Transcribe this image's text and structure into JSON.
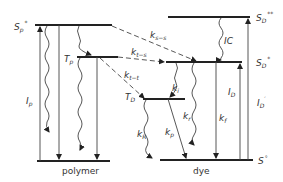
{
  "diagram": {
    "type": "energy-level (Jablonski) diagram",
    "groups": {
      "polymer": {
        "caption": "polymer"
      },
      "dye": {
        "caption": "dye"
      }
    },
    "levels": {
      "sp_star": {
        "label": "S",
        "sub": "p",
        "sup": "*"
      },
      "tp": {
        "label": "T",
        "sub": "p"
      },
      "sd_star2": {
        "label": "S",
        "sub": "D",
        "sup": "**"
      },
      "sd_star": {
        "label": "S",
        "sub": "D",
        "sup": "*"
      },
      "td": {
        "label": "T",
        "sub": "D"
      },
      "s0": {
        "label": "S",
        "sup": "°"
      }
    },
    "transitions": {
      "ip": {
        "label": "I",
        "sub": "p"
      },
      "ks_s": {
        "label": "k",
        "sub": "s−s"
      },
      "kt_s": {
        "label": "k",
        "sub": "t−s"
      },
      "kt_t": {
        "label": "k",
        "sub": "t−t"
      },
      "ic": {
        "label": "IC"
      },
      "ki": {
        "label": "k",
        "sub": "i"
      },
      "kr": {
        "label": "k",
        "sub": "r"
      },
      "kf": {
        "label": "k",
        "sub": "f"
      },
      "kR": {
        "label": "k",
        "sub": "R"
      },
      "kp": {
        "label": "k",
        "sub": "p"
      },
      "id": {
        "label": "I",
        "sub": "D"
      },
      "id_prime": {
        "label": "I",
        "sub": "D",
        "sup": "′"
      }
    }
  }
}
